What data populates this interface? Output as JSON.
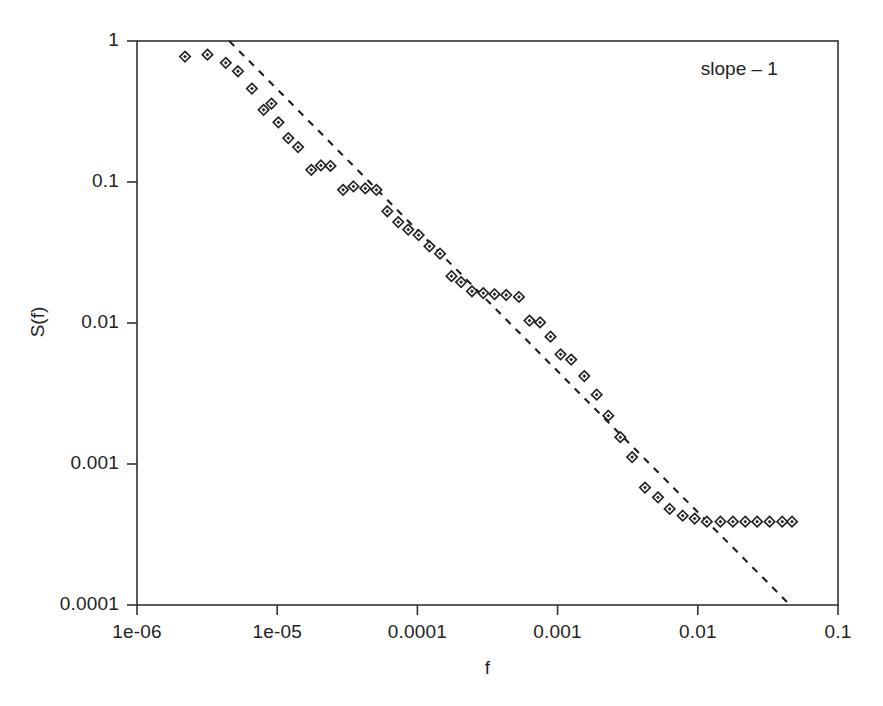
{
  "chart_data": {
    "type": "scatter",
    "title": "",
    "xlabel": "f",
    "ylabel": "S(f)",
    "xscale": "log",
    "yscale": "log",
    "xlim": [
      1e-06,
      0.1
    ],
    "ylim": [
      0.0001,
      1
    ],
    "grid": false,
    "legend": null,
    "xtick_labels": [
      "1e-06",
      "1e-05",
      "0.0001",
      "0.001",
      "0.01",
      "0.1"
    ],
    "xtick_values": [
      1e-06,
      1e-05,
      0.0001,
      0.001,
      0.01,
      0.1
    ],
    "ytick_labels": [
      "1",
      "0.1",
      "0.01",
      "0.001",
      "0.0001"
    ],
    "ytick_values": [
      1,
      0.1,
      0.01,
      0.001,
      0.0001
    ],
    "annotations": [
      {
        "text": "slope – 1",
        "x": 0.022,
        "y": 0.62
      }
    ],
    "series": [
      {
        "name": "S(f)",
        "marker": "diamond",
        "color": "#262626",
        "points": [
          [
            2.2e-06,
            0.775
          ],
          [
            3.18e-06,
            0.8
          ],
          [
            4.3e-06,
            0.7
          ],
          [
            5.25e-06,
            0.61
          ],
          [
            6.6e-06,
            0.46
          ],
          [
            8e-06,
            0.325
          ],
          [
            9.1e-06,
            0.36
          ],
          [
            1.02e-05,
            0.265
          ],
          [
            1.2e-05,
            0.205
          ],
          [
            1.41e-05,
            0.177
          ],
          [
            1.75e-05,
            0.122
          ],
          [
            2.05e-05,
            0.131
          ],
          [
            2.4e-05,
            0.13
          ],
          [
            2.95e-05,
            0.088
          ],
          [
            3.5e-05,
            0.093
          ],
          [
            4.25e-05,
            0.09
          ],
          [
            5.1e-05,
            0.088
          ],
          [
            6.1e-05,
            0.062
          ],
          [
            7.3e-05,
            0.052
          ],
          [
            8.6e-05,
            0.046
          ],
          [
            0.000102,
            0.042
          ],
          [
            0.000122,
            0.035
          ],
          [
            0.000145,
            0.031
          ],
          [
            0.000175,
            0.0215
          ],
          [
            0.000205,
            0.0195
          ],
          [
            0.000245,
            0.0168
          ],
          [
            0.000295,
            0.0163
          ],
          [
            0.000355,
            0.016
          ],
          [
            0.00043,
            0.0158
          ],
          [
            0.00053,
            0.0153
          ],
          [
            0.00063,
            0.0104
          ],
          [
            0.00075,
            0.0101
          ],
          [
            0.00089,
            0.008
          ],
          [
            0.00105,
            0.006
          ],
          [
            0.00125,
            0.0055
          ],
          [
            0.00155,
            0.0042
          ],
          [
            0.0019,
            0.0031
          ],
          [
            0.0023,
            0.0022
          ],
          [
            0.0028,
            0.00155
          ],
          [
            0.0034,
            0.00112
          ],
          [
            0.0042,
            0.00068
          ],
          [
            0.0052,
            0.00058
          ],
          [
            0.0063,
            0.00048
          ],
          [
            0.0078,
            0.00043
          ],
          [
            0.0095,
            0.00041
          ],
          [
            0.0116,
            0.00039
          ],
          [
            0.0145,
            0.00039
          ],
          [
            0.0178,
            0.00039
          ],
          [
            0.0218,
            0.00039
          ],
          [
            0.0265,
            0.00039
          ],
          [
            0.0325,
            0.00039
          ],
          [
            0.04,
            0.00039
          ],
          [
            0.047,
            0.00039
          ]
        ]
      }
    ],
    "fit_line": {
      "name": "slope -1 reference line",
      "style": "dashed",
      "color": "#1f1f1f",
      "slope": -1,
      "start": [
        4.55e-06,
        1.0
      ],
      "end": [
        0.0455,
        0.0001
      ]
    }
  }
}
